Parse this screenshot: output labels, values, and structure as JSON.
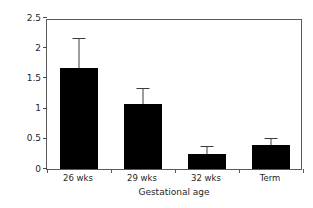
{
  "chart_data": {
    "type": "bar",
    "title": "",
    "subtitle": "",
    "xlabel": "Gestational age",
    "ylabel": "mg kg⁻¹min⁻¹",
    "ylabel_parts": {
      "base1": "mg kg",
      "exp1": "-1",
      "base2": "min",
      "exp2": "-1"
    },
    "categories": [
      "26 wks",
      "29 wks",
      "32 wks",
      "Term"
    ],
    "values": [
      1.67,
      1.08,
      0.25,
      0.4
    ],
    "errors_upper": [
      2.15,
      1.32,
      0.37,
      0.5
    ],
    "error_magnitudes": [
      0.48,
      0.24,
      0.12,
      0.1
    ],
    "ylim": [
      0,
      2.5
    ],
    "ytick_values": [
      0,
      0.5,
      1,
      1.5,
      2,
      2.5
    ],
    "ytick_labels": [
      "0",
      "0.5",
      "1",
      "1.5",
      "2",
      "2.5"
    ],
    "grid": false,
    "legend": false,
    "legend_position": "none",
    "bar_color": "#000000",
    "error_color": "#3c3c3c",
    "axis_color": "#5a5a5a",
    "background": "#ffffff"
  }
}
